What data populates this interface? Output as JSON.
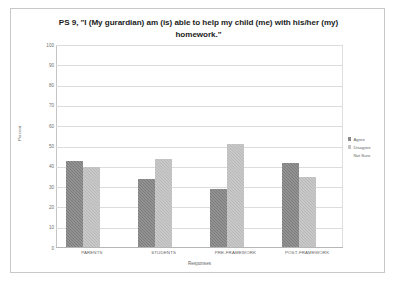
{
  "chart_data": {
    "type": "bar",
    "title": "PS 9, \"I (My gurardian) am (is) able to help my child (me) with his/her (my) homework.\"",
    "xlabel": "Responses",
    "ylabel": "Percent",
    "ylim": [
      0,
      100
    ],
    "ytick_labels": [
      "100",
      "90",
      "80",
      "70",
      "60",
      "50",
      "40",
      "30",
      "20",
      "10",
      "0"
    ],
    "ytick_values": [
      100,
      90,
      80,
      70,
      60,
      50,
      40,
      30,
      20,
      10,
      0
    ],
    "grid": true,
    "legend_position": "right",
    "categories": [
      "PARENTS",
      "STUDENTS",
      "PRE-FRAMEWORK",
      "POST-FRAMEWORK"
    ],
    "series": [
      {
        "name": "Agree",
        "color": "#7c7c7c",
        "values": [
          43,
          34,
          29,
          42
        ]
      },
      {
        "name": "Disagree",
        "color": "#b9b9b9",
        "values": [
          40,
          44,
          51,
          35
        ]
      },
      {
        "name": "Not Sure",
        "color": "#949494",
        "values": [
          18,
          22,
          20,
          24
        ]
      }
    ]
  }
}
